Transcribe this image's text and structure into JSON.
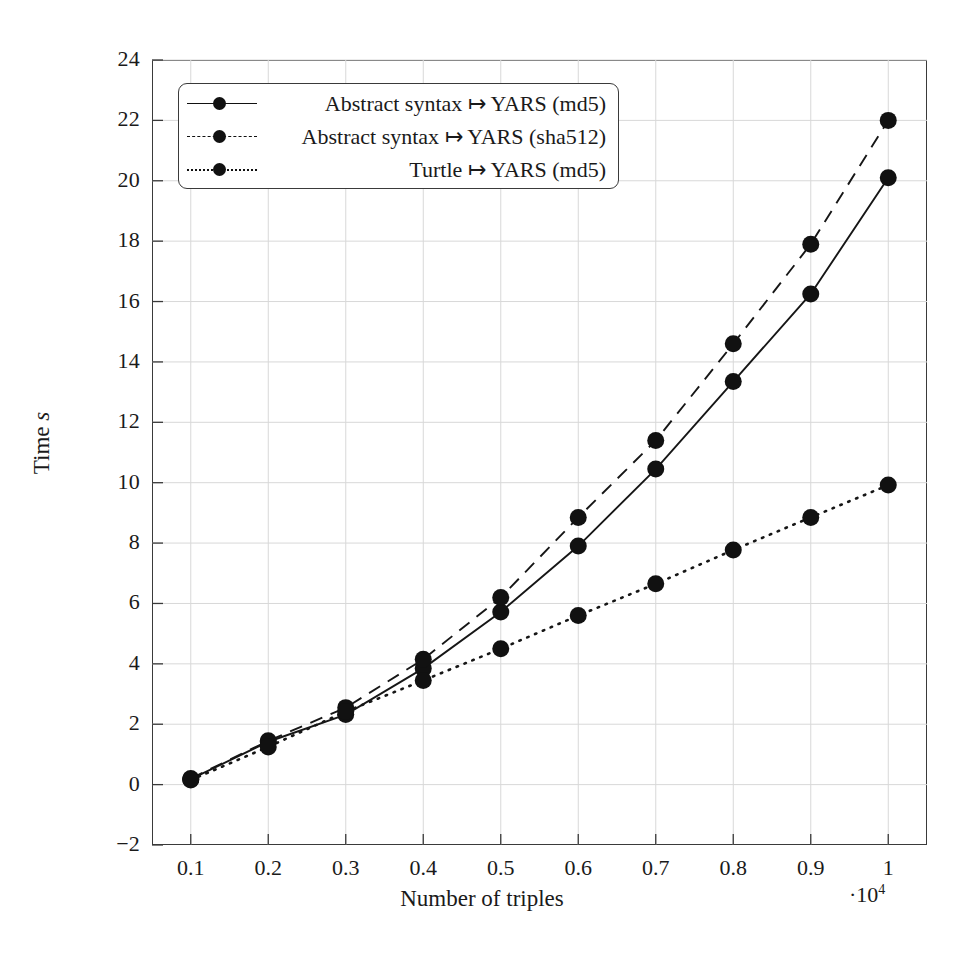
{
  "chart_data": {
    "type": "line",
    "title": "",
    "xlabel": "Number of triples",
    "ylabel": "Time s",
    "x_multiplier": "·10",
    "x_multiplier_exp": "4",
    "xlim": [
      0.05,
      1.05
    ],
    "ylim": [
      -2,
      24
    ],
    "grid": true,
    "legend_position": "top-left",
    "x": [
      0.1,
      0.2,
      0.3,
      0.4,
      0.5,
      0.6,
      0.7,
      0.8,
      0.9,
      1.0
    ],
    "xticks": [
      "0.1",
      "0.2",
      "0.3",
      "0.4",
      "0.5",
      "0.6",
      "0.7",
      "0.8",
      "0.9",
      "1"
    ],
    "yticks": [
      "-2",
      "0",
      "2",
      "4",
      "6",
      "8",
      "10",
      "12",
      "14",
      "16",
      "18",
      "20",
      "22",
      "24"
    ],
    "series": [
      {
        "name": "Abstract syntax ↦ YARS (md5)",
        "style": "solid",
        "marker": "circle",
        "values": [
          0.18,
          1.42,
          2.32,
          3.85,
          5.72,
          7.9,
          10.45,
          13.35,
          16.25,
          20.1
        ]
      },
      {
        "name": "Abstract syntax ↦ YARS (sha512)",
        "style": "dashed",
        "marker": "circle",
        "values": [
          0.2,
          1.45,
          2.55,
          4.15,
          6.2,
          8.85,
          11.4,
          14.6,
          17.9,
          22.0
        ]
      },
      {
        "name": "Turtle ↦ YARS (md5)",
        "style": "dotted",
        "marker": "circle",
        "values": [
          0.15,
          1.25,
          2.42,
          3.45,
          4.5,
          5.6,
          6.65,
          7.77,
          8.85,
          9.92
        ]
      }
    ]
  },
  "legend": {
    "items": [
      {
        "label": "Abstract syntax ↦ YARS (md5)"
      },
      {
        "label": "Abstract syntax ↦ YARS (sha512)"
      },
      {
        "label": "Turtle ↦ YARS (md5)"
      }
    ]
  }
}
